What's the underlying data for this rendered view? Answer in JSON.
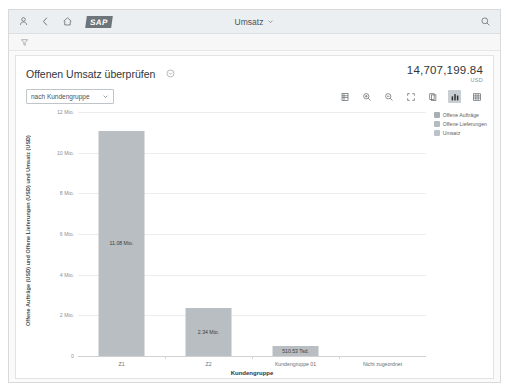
{
  "shell": {
    "icons": [
      "person-icon",
      "back-chevron-icon",
      "home-icon"
    ],
    "logo": "SAP",
    "title": "Umsatz",
    "search_icon": "search-icon"
  },
  "filter_bar": {
    "icon": "filter-icon"
  },
  "card": {
    "title": "Offenen Umsatz überprüfen",
    "title_menu_icon": "chevron-down-circle-icon",
    "kpi_value": "14,707,199.84",
    "kpi_unit": "USD"
  },
  "toolbar": {
    "dropdown_value": "nach Kundengruppe",
    "dropdown_chevron": "chevron-down-icon",
    "buttons": [
      {
        "name": "legend-toggle-icon",
        "active": false
      },
      {
        "name": "zoom-in-icon",
        "active": false
      },
      {
        "name": "zoom-out-icon",
        "active": false
      },
      {
        "name": "fullscreen-icon",
        "active": false
      },
      {
        "name": "copy-icon",
        "active": false
      },
      {
        "name": "bar-chart-view-icon",
        "active": true
      },
      {
        "name": "table-view-icon",
        "active": false
      }
    ]
  },
  "chart_data": {
    "type": "bar",
    "title": "Offenen Umsatz überprüfen",
    "categories": [
      "Z1",
      "Z2",
      "Kundengruppe 01",
      "Nicht zugeordnet"
    ],
    "values": [
      11080000,
      2340000,
      510530,
      0
    ],
    "value_labels": [
      "11.08 Mio.",
      "2.34 Mio.",
      "510.53 Tsd.",
      ""
    ],
    "series": [
      {
        "name": "Umsatz",
        "values": [
          11080000,
          2340000,
          510530,
          0
        ],
        "labels": [
          "11.08 Mio.",
          "2.34 Mio.",
          "510.53 Tsd.",
          ""
        ]
      }
    ],
    "xlabel": "Kundengruppe",
    "ylabel": "Offene Aufträge (USD) und Offene Lieferungen (USD) und Umsatz (USD)",
    "ylim": [
      0,
      12000000
    ],
    "yticks": [
      0,
      2000000,
      4000000,
      6000000,
      8000000,
      10000000,
      12000000
    ],
    "ytick_labels": [
      "0",
      "2 Mio.",
      "4 Mio.",
      "6 Mio.",
      "8 Mio.",
      "10 Mio.",
      "12 Mio."
    ],
    "grid": true,
    "legend_position": "right",
    "legend": [
      {
        "label": "Offene Aufträge",
        "color": "#a8b0b6"
      },
      {
        "label": "Offene Lieferungen",
        "color": "#b4bcc2"
      },
      {
        "label": "Umsatz",
        "color": "#bcc3c8"
      }
    ],
    "bar_color": "#b9bec2"
  }
}
